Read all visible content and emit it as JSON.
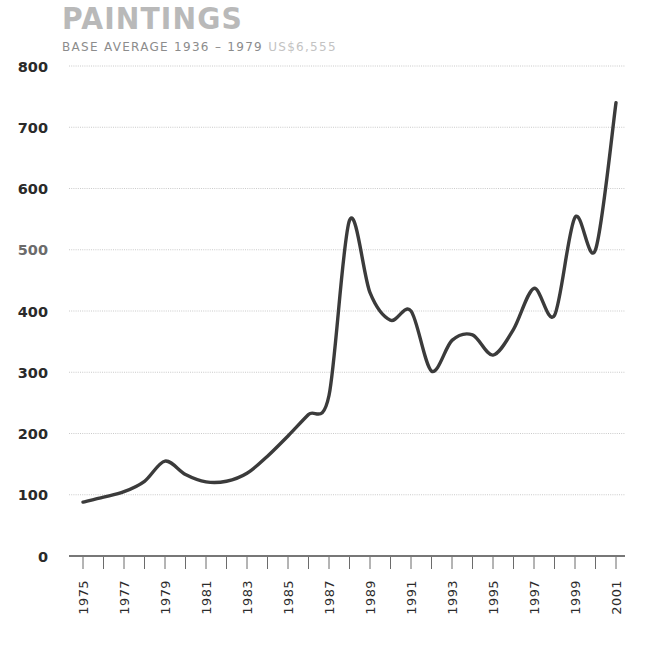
{
  "header": {
    "title": "PAINTINGS",
    "subtitle_strong": "BASE AVERAGE 1936 – 1979",
    "subtitle_faint": "US$6,555",
    "subtitle_full": "BASE AVERAGE 1936 – 1979 US$6,555"
  },
  "colors": {
    "title": "#b9b9b9",
    "subtitle": "#9a9a9a",
    "subtitle_faint": "#c3c3c3",
    "line": "#3b3b3b",
    "grid": "#bcbcbc",
    "axis": "#4a4a4a",
    "tick_label": "#2c2c2c",
    "background": "#ffffff"
  },
  "chart_data": {
    "type": "line",
    "title": "PAINTINGS",
    "subtitle": "BASE AVERAGE 1936 – 1979 US$6,555",
    "xlabel": "",
    "ylabel": "",
    "xlim": [
      1975,
      2001
    ],
    "ylim": [
      0,
      800
    ],
    "grid": true,
    "legend": "none",
    "y_ticks": [
      0,
      100,
      200,
      300,
      400,
      500,
      600,
      700,
      800
    ],
    "y_tick_labels": [
      "0",
      "100",
      "200",
      "300",
      "400",
      "500",
      "600",
      "700",
      "800"
    ],
    "x_ticks": [
      1975,
      1976,
      1977,
      1978,
      1979,
      1980,
      1981,
      1982,
      1983,
      1984,
      1985,
      1986,
      1987,
      1988,
      1989,
      1990,
      1991,
      1992,
      1993,
      1994,
      1995,
      1996,
      1997,
      1998,
      1999,
      2000,
      2001
    ],
    "x_tick_labels": [
      "1975",
      "1977",
      "1979",
      "1981",
      "1983",
      "1985",
      "1987",
      "1989",
      "1991",
      "1993",
      "1995",
      "1997",
      "1999",
      "2001"
    ],
    "x_tick_labels_years": [
      1975,
      1977,
      1979,
      1981,
      1983,
      1985,
      1987,
      1989,
      1991,
      1993,
      1995,
      1997,
      1999,
      2001
    ],
    "x": [
      1975,
      1976,
      1977,
      1978,
      1979,
      1980,
      1981,
      1982,
      1983,
      1984,
      1985,
      1986,
      1987,
      1988,
      1989,
      1990,
      1991,
      1992,
      1993,
      1994,
      1995,
      1996,
      1997,
      1998,
      1999,
      2000,
      2001
    ],
    "values": [
      88,
      96,
      105,
      122,
      155,
      133,
      121,
      122,
      135,
      163,
      196,
      231,
      262,
      548,
      430,
      385,
      400,
      302,
      352,
      361,
      328,
      370,
      437,
      393,
      553,
      500,
      740
    ],
    "series": [
      {
        "name": "Paintings index",
        "values": [
          88,
          96,
          105,
          122,
          155,
          133,
          121,
          122,
          135,
          163,
          196,
          231,
          262,
          548,
          430,
          385,
          400,
          302,
          352,
          361,
          328,
          370,
          437,
          393,
          553,
          500,
          740
        ]
      }
    ],
    "annotations": []
  }
}
